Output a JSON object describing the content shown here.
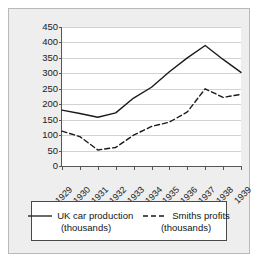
{
  "chart_data": {
    "type": "line",
    "title": "",
    "xlabel": "",
    "ylabel": "",
    "categories": [
      "1929",
      "1930",
      "1931",
      "1932",
      "1933",
      "1934",
      "1935",
      "1936",
      "1937",
      "1938",
      "1939"
    ],
    "ylim": [
      0,
      450
    ],
    "ytick_values": [
      0,
      50,
      100,
      150,
      200,
      250,
      300,
      350,
      400,
      450
    ],
    "ytick_labels": [
      "0",
      "50",
      "100",
      "150",
      "200",
      "250",
      "300",
      "350",
      "400",
      "450"
    ],
    "grid": true,
    "legend_position": "bottom",
    "series": [
      {
        "name": "UK car production",
        "unit": "(thousands)",
        "style": "solid",
        "color": "#1a1a1a",
        "values": [
          181,
          170,
          158,
          172,
          220,
          255,
          305,
          350,
          390,
          345,
          303
        ]
      },
      {
        "name": "Smiths profits",
        "unit": "(thousands)",
        "style": "dashed",
        "color": "#1a1a1a",
        "values": [
          113,
          95,
          52,
          60,
          100,
          128,
          142,
          175,
          250,
          222,
          232
        ]
      }
    ]
  },
  "legend": {
    "entries": [
      {
        "label": "UK car production",
        "sub": "(thousands)",
        "swatch": "solid-line-swatch"
      },
      {
        "label": "Smiths profits",
        "sub": "(thousands)",
        "swatch": "dashed-line-swatch"
      }
    ]
  }
}
